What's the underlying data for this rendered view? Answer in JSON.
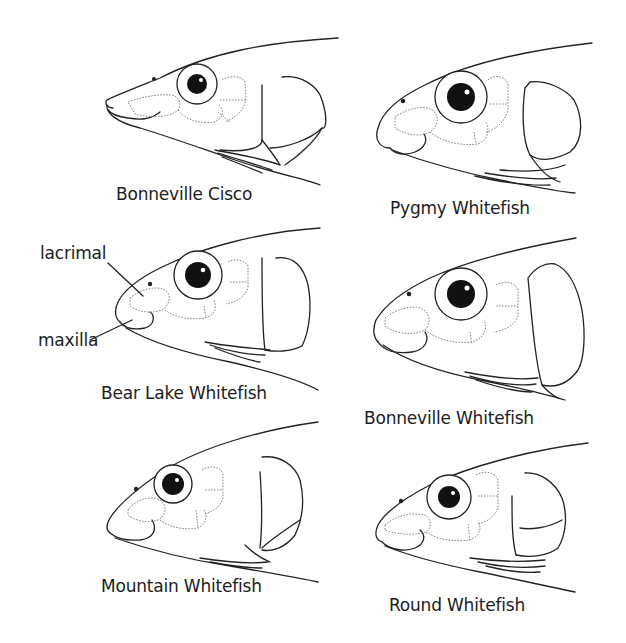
{
  "figure": {
    "panels": [
      {
        "id": "bonneville-cisco",
        "label": "Bonneville Cisco"
      },
      {
        "id": "pygmy-whitefish",
        "label": "Pygmy Whitefish"
      },
      {
        "id": "bear-lake-whitefish",
        "label": "Bear Lake Whitefish"
      },
      {
        "id": "bonneville-whitefish",
        "label": "Bonneville Whitefish"
      },
      {
        "id": "mountain-whitefish",
        "label": "Mountain Whitefish"
      },
      {
        "id": "round-whitefish",
        "label": "Round Whitefish"
      }
    ],
    "annotations": {
      "lacrimal": "lacrimal",
      "maxilla": "maxilla"
    }
  }
}
